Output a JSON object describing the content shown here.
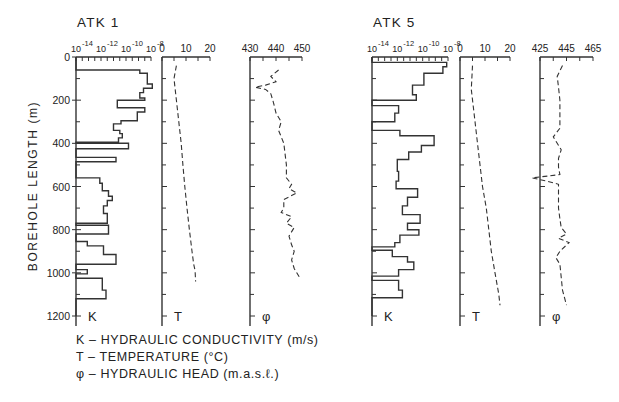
{
  "chart_data": {
    "type": "line",
    "ylabel": "BOREHOLE LENGTH (m)",
    "ylim": [
      0,
      1200
    ],
    "yticks": [
      0,
      200,
      400,
      600,
      800,
      1000,
      1200
    ],
    "y_invert": true,
    "legend": [
      {
        "symbol": "K",
        "text": "HYDRAULIC CONDUCTIVITY (m/s)"
      },
      {
        "symbol": "T",
        "text": "TEMPERATURE (°C)"
      },
      {
        "symbol": "φ",
        "text": "HYDRAULIC HEAD (m.a.s.ℓ.)"
      }
    ],
    "boreholes": [
      {
        "name": "ATK 1",
        "panels": [
          {
            "id": "K",
            "label": "K",
            "type": "step",
            "xscale": "log10",
            "xlim": [
              -14,
              -8
            ],
            "xtick_labels": [
              "10⁻¹⁴",
              "10⁻¹²",
              "10⁻¹⁰",
              "10⁻⁸"
            ],
            "xticks": [
              -14,
              -12,
              -10,
              -8
            ],
            "steps": [
              {
                "from": 0,
                "to": 60,
                "logK": -14
              },
              {
                "from": 60,
                "to": 75,
                "logK": -8.9
              },
              {
                "from": 75,
                "to": 125,
                "logK": -8.3
              },
              {
                "from": 125,
                "to": 145,
                "logK": -7.9
              },
              {
                "from": 145,
                "to": 165,
                "logK": -8.6
              },
              {
                "from": 165,
                "to": 190,
                "logK": -8.9
              },
              {
                "from": 190,
                "to": 200,
                "logK": -8.5
              },
              {
                "from": 200,
                "to": 235,
                "logK": -10.7
              },
              {
                "from": 235,
                "to": 255,
                "logK": -8.5
              },
              {
                "from": 255,
                "to": 295,
                "logK": -9.1
              },
              {
                "from": 295,
                "to": 310,
                "logK": -10.4
              },
              {
                "from": 310,
                "to": 340,
                "logK": -11.0
              },
              {
                "from": 340,
                "to": 355,
                "logK": -10.5
              },
              {
                "from": 355,
                "to": 375,
                "logK": -10.3
              },
              {
                "from": 375,
                "to": 395,
                "logK": -10.6
              },
              {
                "from": 395,
                "to": 400,
                "logK": -14
              },
              {
                "from": 400,
                "to": 425,
                "logK": -9.8
              },
              {
                "from": 425,
                "to": 465,
                "logK": -14
              },
              {
                "from": 465,
                "to": 485,
                "logK": -10.8
              },
              {
                "from": 485,
                "to": 560,
                "logK": -14
              },
              {
                "from": 560,
                "to": 585,
                "logK": -12.1
              },
              {
                "from": 585,
                "to": 620,
                "logK": -11.9
              },
              {
                "from": 620,
                "to": 645,
                "logK": -11.4
              },
              {
                "from": 645,
                "to": 665,
                "logK": -11.1
              },
              {
                "from": 665,
                "to": 690,
                "logK": -11.5
              },
              {
                "from": 690,
                "to": 725,
                "logK": -11.8
              },
              {
                "from": 725,
                "to": 770,
                "logK": -11.5
              },
              {
                "from": 770,
                "to": 780,
                "logK": -14
              },
              {
                "from": 780,
                "to": 820,
                "logK": -11.4
              },
              {
                "from": 820,
                "to": 855,
                "logK": -14
              },
              {
                "from": 855,
                "to": 875,
                "logK": -13.1
              },
              {
                "from": 875,
                "to": 915,
                "logK": -11.8
              },
              {
                "from": 915,
                "to": 960,
                "logK": -10.8
              },
              {
                "from": 960,
                "to": 985,
                "logK": -14
              },
              {
                "from": 985,
                "to": 1005,
                "logK": -13.1
              },
              {
                "from": 1005,
                "to": 1025,
                "logK": -14
              },
              {
                "from": 1025,
                "to": 1080,
                "logK": -11.9
              },
              {
                "from": 1080,
                "to": 1120,
                "logK": -11.6
              },
              {
                "from": 1120,
                "to": 1200,
                "logK": -14
              }
            ]
          },
          {
            "id": "T",
            "label": "T",
            "type": "dashed-line",
            "xlim": [
              0,
              20
            ],
            "xticks": [
              0,
              10,
              20
            ],
            "depth": [
              40,
              100,
              200,
              300,
              400,
              500,
              600,
              700,
              800,
              900,
              960,
              990,
              1040
            ],
            "values": [
              6,
              5,
              6,
              7,
              8,
              8.7,
              9.5,
              10.4,
              11.4,
              12.5,
              13.2,
              13.8,
              14
            ]
          },
          {
            "id": "phi",
            "label": "φ",
            "type": "dashed-line",
            "xlim": [
              430,
              450
            ],
            "xticks": [
              430,
              440,
              450
            ],
            "depth": [
              60,
              90,
              115,
              130,
              140,
              150,
              170,
              210,
              260,
              300,
              340,
              400,
              500,
              560,
              590,
              610,
              630,
              660,
              700,
              720,
              740,
              770,
              790,
              830,
              870,
              900,
              940,
              980,
              1020
            ],
            "values": [
              441,
              438,
              440,
              436,
              432,
              436,
              438,
              439,
              440,
              442,
              441,
              443,
              444,
              444,
              446,
              445,
              448,
              443,
              443,
              442,
              446,
              444,
              447,
              445,
              446,
              447,
              446,
              447,
              449
            ]
          }
        ]
      },
      {
        "name": "ATK 5",
        "panels": [
          {
            "id": "K",
            "label": "K",
            "type": "step",
            "xscale": "log10",
            "xlim": [
              -14,
              -8
            ],
            "xtick_labels": [
              "10⁻¹⁴",
              "10⁻¹²",
              "10⁻¹⁰",
              "10⁻⁸"
            ],
            "xticks": [
              -14,
              -12,
              -10,
              -8
            ],
            "steps": [
              {
                "from": 0,
                "to": 25,
                "logK": -14
              },
              {
                "from": 25,
                "to": 45,
                "logK": -8.1
              },
              {
                "from": 45,
                "to": 75,
                "logK": -8.4
              },
              {
                "from": 75,
                "to": 130,
                "logK": -9.9
              },
              {
                "from": 130,
                "to": 175,
                "logK": -10.8
              },
              {
                "from": 175,
                "to": 200,
                "logK": -10.5
              },
              {
                "from": 200,
                "to": 225,
                "logK": -14
              },
              {
                "from": 225,
                "to": 260,
                "logK": -11.9
              },
              {
                "from": 260,
                "to": 300,
                "logK": -12.2
              },
              {
                "from": 300,
                "to": 340,
                "logK": -14
              },
              {
                "from": 340,
                "to": 365,
                "logK": -11.8
              },
              {
                "from": 365,
                "to": 410,
                "logK": -9.1
              },
              {
                "from": 410,
                "to": 440,
                "logK": -10.1
              },
              {
                "from": 440,
                "to": 475,
                "logK": -11.1
              },
              {
                "from": 475,
                "to": 530,
                "logK": -12.0
              },
              {
                "from": 530,
                "to": 575,
                "logK": -11.9
              },
              {
                "from": 575,
                "to": 610,
                "logK": -12.1
              },
              {
                "from": 610,
                "to": 650,
                "logK": -10.4
              },
              {
                "from": 650,
                "to": 690,
                "logK": -11.2
              },
              {
                "from": 690,
                "to": 730,
                "logK": -11.6
              },
              {
                "from": 730,
                "to": 770,
                "logK": -10.2
              },
              {
                "from": 770,
                "to": 800,
                "logK": -11.2
              },
              {
                "from": 800,
                "to": 825,
                "logK": -10.3
              },
              {
                "from": 825,
                "to": 860,
                "logK": -11.8
              },
              {
                "from": 860,
                "to": 880,
                "logK": -12.2
              },
              {
                "from": 880,
                "to": 895,
                "logK": -14
              },
              {
                "from": 895,
                "to": 925,
                "logK": -12.4
              },
              {
                "from": 925,
                "to": 950,
                "logK": -11.2
              },
              {
                "from": 950,
                "to": 985,
                "logK": -10.7
              },
              {
                "from": 985,
                "to": 1015,
                "logK": -11.9
              },
              {
                "from": 1015,
                "to": 1035,
                "logK": -14
              },
              {
                "from": 1035,
                "to": 1080,
                "logK": -11.9
              },
              {
                "from": 1080,
                "to": 1115,
                "logK": -11.6
              },
              {
                "from": 1115,
                "to": 1200,
                "logK": -14
              }
            ]
          },
          {
            "id": "T",
            "label": "T",
            "type": "dashed-line",
            "xlim": [
              0,
              20
            ],
            "xticks": [
              0,
              10,
              20
            ],
            "depth": [
              40,
              150,
              250,
              400,
              500,
              600,
              700,
              800,
              900,
              1000,
              1100,
              1150
            ],
            "values": [
              5,
              4.5,
              5.5,
              7,
              8,
              9,
              10.5,
              11.5,
              12.5,
              14,
              15.5,
              16
            ]
          },
          {
            "id": "phi",
            "label": "φ",
            "type": "dashed-line",
            "xlim": [
              425,
              465
            ],
            "xticks": [
              425,
              445,
              465
            ],
            "depth": [
              40,
              90,
              140,
              200,
              260,
              330,
              370,
              400,
              430,
              470,
              510,
              545,
              560,
              575,
              590,
              650,
              700,
              750,
              790,
              820,
              840,
              860,
              900,
              930,
              960,
              1020,
              1080,
              1150
            ],
            "values": [
              442,
              438,
              439,
              440,
              440,
              440,
              435,
              438,
              441,
              439,
              439,
              440,
              419,
              430,
              439,
              439,
              439,
              440,
              441,
              445,
              439,
              447,
              440,
              437,
              440,
              441,
              442,
              445
            ]
          }
        ]
      }
    ]
  }
}
